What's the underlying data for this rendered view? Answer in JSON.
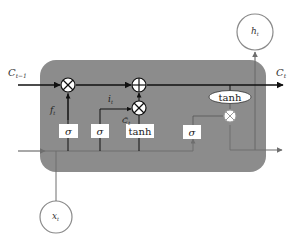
{
  "diagram": {
    "colors": {
      "cell_body": "#8c8c8c",
      "cell_state_line": "#111111",
      "input_line": "#6e6e6e",
      "gate_box": "#ffffff",
      "node_circle": "#ffffff",
      "text": "#222222"
    },
    "labels": {
      "c_prev": "C",
      "c_prev_sub": "t−1",
      "c_next": "C",
      "c_next_sub": "t",
      "h_out": "h",
      "h_out_sub": "t",
      "x_in": "x",
      "x_in_sub": "t",
      "f_gate": "f",
      "f_gate_sub": "t",
      "i_gate": "i",
      "i_gate_sub": "t",
      "c_tilde": "C̃",
      "c_tilde_sub": "t"
    },
    "gates": [
      {
        "id": "forget",
        "label": "σ"
      },
      {
        "id": "input",
        "label": "σ"
      },
      {
        "id": "candidate",
        "label": "tanh"
      },
      {
        "id": "output",
        "label": "σ"
      }
    ],
    "ops": {
      "multiply": "⊗",
      "add": "⊕",
      "tanh_ellipse": "tanh"
    }
  }
}
